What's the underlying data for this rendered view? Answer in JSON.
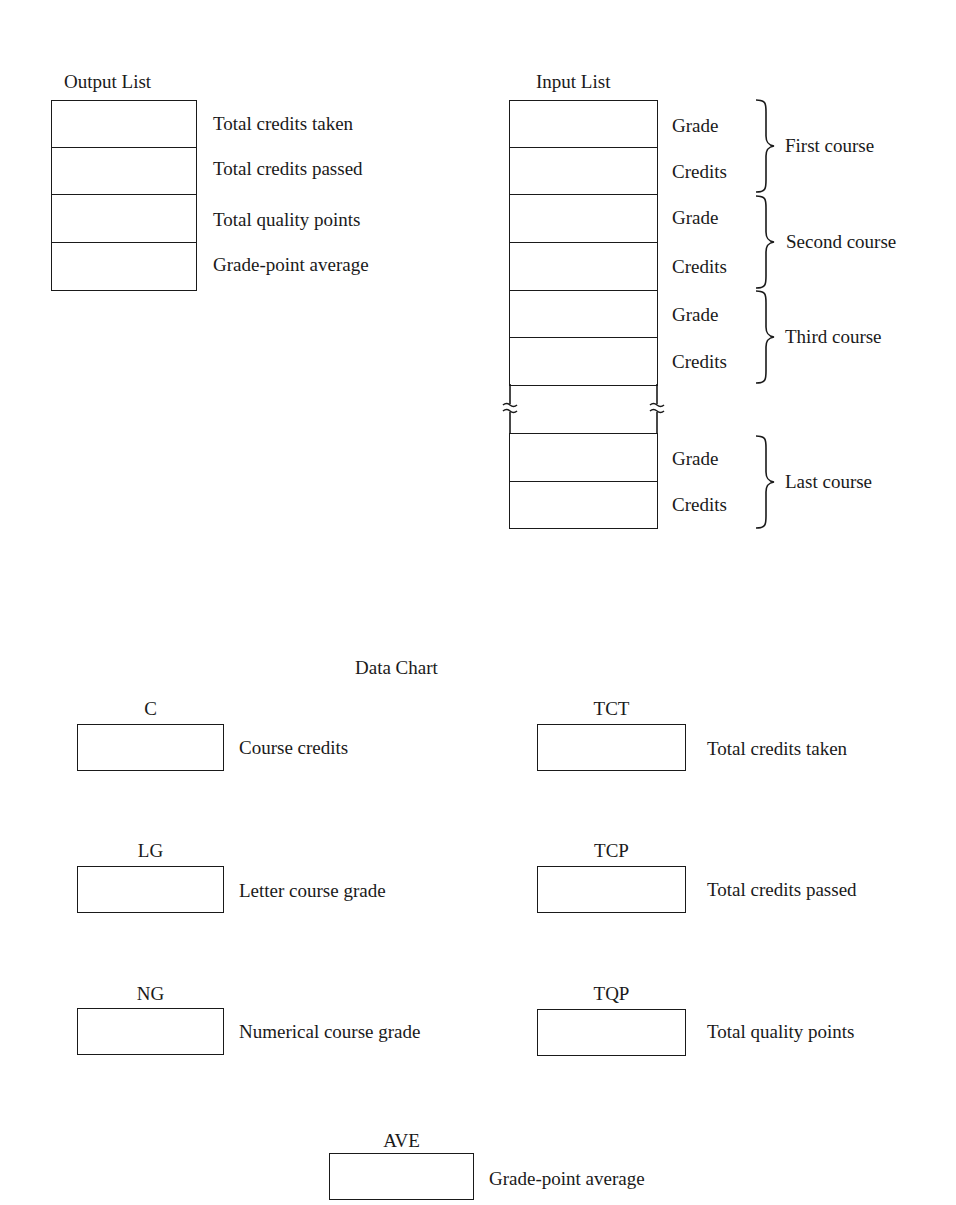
{
  "output_list": {
    "title": "Output List",
    "rows": [
      {
        "label": "Total credits taken"
      },
      {
        "label": "Total credits passed"
      },
      {
        "label": "Total quality points"
      },
      {
        "label": "Grade-point average"
      }
    ]
  },
  "input_list": {
    "title": "Input List",
    "groups": [
      {
        "course": "First course",
        "fields": [
          "Grade",
          "Credits"
        ]
      },
      {
        "course": "Second course",
        "fields": [
          "Grade",
          "Credits"
        ]
      },
      {
        "course": "Third course",
        "fields": [
          "Grade",
          "Credits"
        ]
      },
      {
        "course": "Last course",
        "fields": [
          "Grade",
          "Credits"
        ]
      }
    ],
    "break_icon": "wavy-break-icon"
  },
  "data_chart": {
    "title": "Data Chart",
    "variables": [
      {
        "name": "C",
        "description": "Course credits"
      },
      {
        "name": "TCT",
        "description": "Total credits taken"
      },
      {
        "name": "LG",
        "description": "Letter course grade"
      },
      {
        "name": "TCP",
        "description": "Total credits passed"
      },
      {
        "name": "NG",
        "description": "Numerical course grade"
      },
      {
        "name": "TQP",
        "description": "Total quality points"
      },
      {
        "name": "AVE",
        "description": "Grade-point average"
      }
    ]
  }
}
